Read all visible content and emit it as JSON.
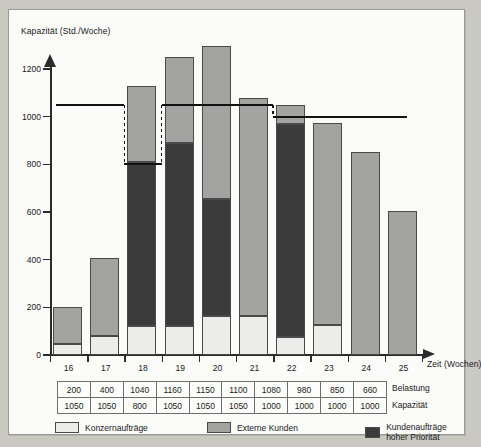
{
  "chart_data": {
    "type": "bar",
    "title": "",
    "ylabel": "Kapazität (Std./Woche)",
    "xlabel": "Zeit (Wochen)",
    "ylim": [
      0,
      1200
    ],
    "yticks": [
      0,
      200,
      400,
      600,
      800,
      1000,
      1200
    ],
    "grid": false,
    "stacked": true,
    "legend_position": "bottom",
    "categories": [
      "16",
      "17",
      "18",
      "19",
      "20",
      "21",
      "22",
      "23",
      "24",
      "25"
    ],
    "series": [
      {
        "name": "Konzernaufträge",
        "color": "#ececea",
        "values": [
          45,
          80,
          120,
          120,
          165,
          165,
          75,
          125,
          0,
          0
        ]
      },
      {
        "name": "Externe Kunden",
        "color": "#a3a3a1",
        "values": [
          155,
          325,
          320,
          360,
          640,
          915,
          80,
          850,
          850,
          605
        ]
      },
      {
        "name": "Kundenaufträge hoher Priorität",
        "color": "#3b3b3b",
        "values": [
          0,
          0,
          690,
          770,
          490,
          0,
          895,
          0,
          0,
          0
        ]
      }
    ],
    "bar_totals": [
      200,
      405,
      1010,
      1130,
      1130,
      1080,
      1050,
      975,
      850,
      605
    ],
    "capacity_line": {
      "label": "Kapazität",
      "segments": [
        {
          "from": "16",
          "to": "17",
          "value": 1050
        },
        {
          "from": "18",
          "to": "18",
          "value": 800
        },
        {
          "from": "19",
          "to": "21",
          "value": 1050
        },
        {
          "from": "22",
          "to": "25",
          "value": 1000
        }
      ]
    },
    "table": {
      "row_labels": [
        "Belastung",
        "Kapazität"
      ],
      "rows": [
        [
          200,
          400,
          1040,
          1160,
          1150,
          1100,
          1080,
          980,
          850,
          660
        ],
        [
          1050,
          1050,
          800,
          1050,
          1050,
          1050,
          1000,
          1000,
          1000,
          1000
        ]
      ]
    },
    "legend": [
      {
        "label": "Konzernaufträge",
        "color": "#ececea"
      },
      {
        "label": "Externe Kunden",
        "color": "#a3a3a1"
      },
      {
        "label": "Kundenaufträge hoher Priorität",
        "color": "#3b3b3b"
      }
    ]
  }
}
